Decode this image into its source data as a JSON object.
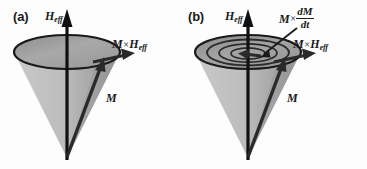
{
  "figure": {
    "background_color": "#fdfdfd",
    "ink_color": "#1a1a1a",
    "cone_fill_color": "#b8b8b8",
    "cone_shadow_color": "#8f8f8f",
    "disk_fill_color": "#a5a5a5",
    "width": 367,
    "height": 169
  },
  "panels": [
    {
      "tag": "(a)",
      "description": "Precession of magnetization M about the effective field H_eff on a cone of constant opening angle; the torque M x H_eff is tangential to the precession circle.",
      "cone": {
        "rim_count": 1,
        "spiral": false
      },
      "labels": {
        "field": "H",
        "field_sub": "eff",
        "magnetization": "M",
        "torque_main": "M",
        "torque_times": "×",
        "torque_field": "H",
        "torque_field_sub": "eff"
      }
    },
    {
      "tag": "(b)",
      "description": "Damped precession: the magnetization M spirals inward toward H_eff; the damping torque M x dM/dt points toward the cone axis while M x H_eff remains tangential.",
      "cone": {
        "rim_count": 4,
        "spiral": true
      },
      "labels": {
        "field": "H",
        "field_sub": "eff",
        "magnetization": "M",
        "torque_main": "M",
        "torque_times": "×",
        "torque_field": "H",
        "torque_field_sub": "eff",
        "damping_main": "M",
        "damping_times": "×",
        "damping_numerator": "dM",
        "damping_denominator": "dt"
      }
    }
  ],
  "icons": {
    "field_arrow": "up-arrow-icon",
    "magnetization_arrow": "diagonal-arrow-icon",
    "torque_arrow": "right-arrow-icon",
    "damping_pointer": "pointer-arrow-icon"
  }
}
